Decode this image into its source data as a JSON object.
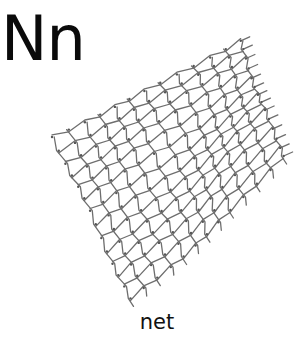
{
  "flashcard": {
    "letter": "Nn",
    "word": "net",
    "illustration": {
      "subject": "fishing-net",
      "stroke_color": "#6e6e6e",
      "corners": {
        "top_left": [
          52,
          137
        ],
        "top_right": [
          240,
          42
        ],
        "bottom_left": [
          132,
          300
        ],
        "bottom_right": [
          282,
          155
        ]
      },
      "cols": 12,
      "rows": 13
    }
  }
}
